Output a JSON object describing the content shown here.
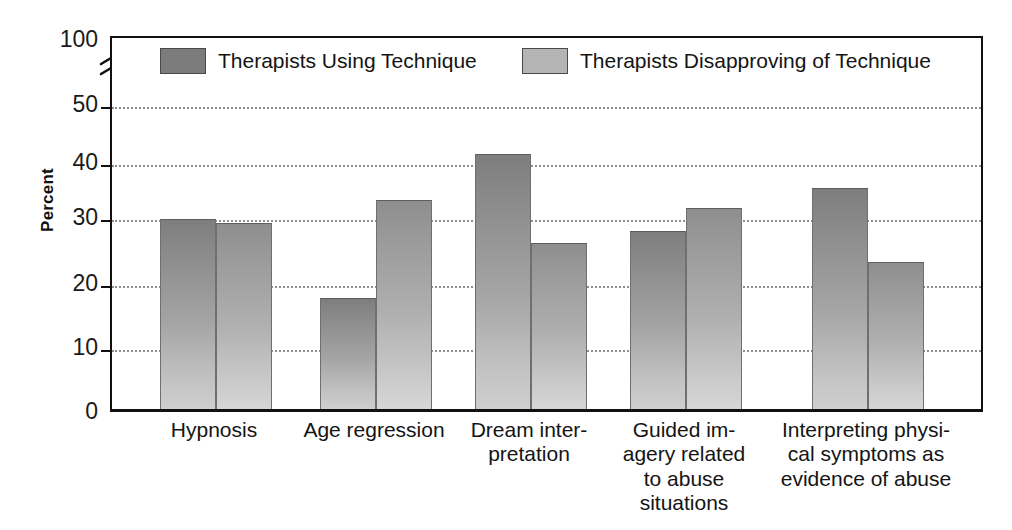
{
  "chart_data": {
    "type": "bar",
    "title": "",
    "xlabel": "",
    "ylabel": "Percent",
    "ylim": [
      0,
      50
    ],
    "grid": true,
    "axis_break": {
      "present": true,
      "between": [
        50,
        100
      ],
      "top_tick": "100"
    },
    "legend_position": "top-inside",
    "categories": [
      "Hypnosis",
      "Age regression",
      "Dream interpretation",
      "Guided imagery related to abuse situations",
      "Interpreting physical symptoms as evidence of abuse"
    ],
    "category_lines": [
      [
        "Hypnosis"
      ],
      [
        "Age regression"
      ],
      [
        "Dream inter-",
        "pretation"
      ],
      [
        "Guided im-",
        "agery related",
        "to abuse",
        "situations"
      ],
      [
        "Interpreting physi-",
        "cal symptoms as",
        "evidence of abuse"
      ]
    ],
    "series": [
      {
        "name": "Therapists Using Technique",
        "color": "#7b7b7b",
        "values": [
          31,
          18,
          41.5,
          29,
          36
        ]
      },
      {
        "name": "Therapists Disapproving of Technique",
        "color": "#b4b4b4",
        "values": [
          30.3,
          34,
          27,
          32.8,
          24
        ]
      }
    ],
    "yticks": [
      "0",
      "10",
      "20",
      "30",
      "40",
      "50",
      "100"
    ],
    "ytick_values": [
      0,
      10,
      20,
      30,
      40,
      50,
      100
    ]
  },
  "axis": {
    "y_label": "Percent",
    "ticks": [
      {
        "label": "100",
        "value": 100
      },
      {
        "label": "50",
        "value": 50
      },
      {
        "label": "40",
        "value": 40
      },
      {
        "label": "30",
        "value": 30
      },
      {
        "label": "20",
        "value": 20
      },
      {
        "label": "10",
        "value": 10
      },
      {
        "label": "0",
        "value": 0
      }
    ]
  },
  "legend": {
    "items": [
      {
        "label": "Therapists Using Technique",
        "color": "#7b7b7b"
      },
      {
        "label": "Therapists Disapproving of Technique",
        "color": "#b4b4b4"
      }
    ]
  }
}
